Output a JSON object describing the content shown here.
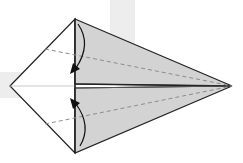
{
  "diagram": {
    "type": "origami-fold-instruction",
    "colors": {
      "background": "#ffffff",
      "background_cross": "#ededed",
      "paper_white": "#ffffff",
      "paper_colored": "#d2d2d2",
      "outline": "#222222",
      "dashed_line": "#8c8c8c",
      "arrow": "#111111"
    },
    "points": {
      "left_tip": [
        10,
        86
      ],
      "top_vertex": [
        75,
        19
      ],
      "bottom_vertex": [
        75,
        153
      ],
      "right_tip": [
        232,
        86
      ]
    },
    "fold_lines": [
      {
        "name": "upper-valley-fold",
        "from": [
          45,
          49
        ],
        "to": [
          232,
          86
        ],
        "style": "dashed"
      },
      {
        "name": "lower-valley-fold",
        "from": [
          45,
          124
        ],
        "to": [
          232,
          86
        ],
        "style": "dashed"
      }
    ],
    "arrows": [
      {
        "name": "upper-fold-arrow",
        "direction": "down"
      },
      {
        "name": "lower-fold-arrow",
        "direction": "up"
      }
    ]
  }
}
